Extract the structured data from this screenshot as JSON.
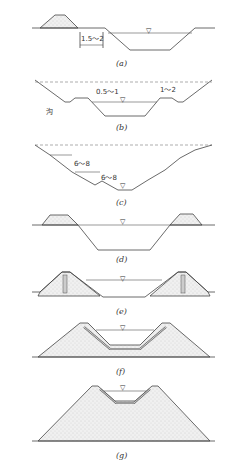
{
  "figure": {
    "type": "canal cross-section types",
    "panels": [
      {
        "id": "a",
        "label": "(a)",
        "dimension": "1.5～2"
      },
      {
        "id": "b",
        "label": "(b)",
        "dimensions": [
          "0.5～1",
          "1～2"
        ],
        "annotation": "沟"
      },
      {
        "id": "c",
        "label": "(c)",
        "dimensions": [
          "6～8",
          "6～8"
        ]
      },
      {
        "id": "d",
        "label": "(d)"
      },
      {
        "id": "e",
        "label": "(e)"
      },
      {
        "id": "f",
        "label": "(f)"
      },
      {
        "id": "g",
        "label": "(g)"
      }
    ],
    "water_level_symbol": "▽"
  }
}
